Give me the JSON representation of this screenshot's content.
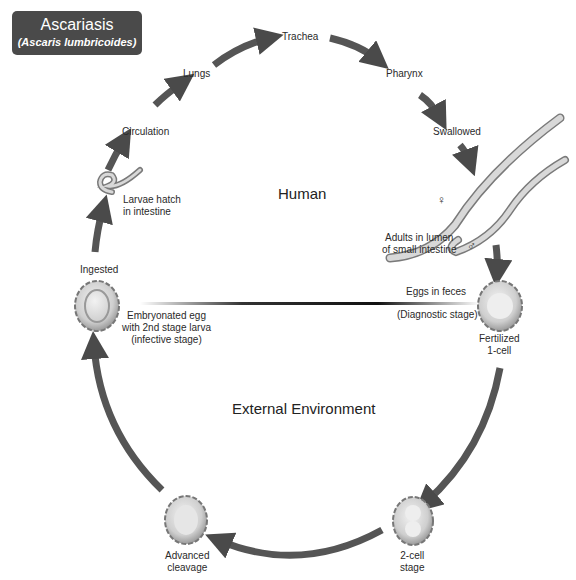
{
  "title": {
    "main": "Ascariasis",
    "subtitle": "(Ascaris lumbricoides)"
  },
  "zones": {
    "upper": "Human",
    "lower": "External Environment"
  },
  "stages": {
    "trachea": "Trachea",
    "lungs": "Lungs",
    "pharynx": "Pharynx",
    "circulation": "Circulation",
    "swallowed": "Swallowed",
    "larvae_hatch_1": "Larvae hatch",
    "larvae_hatch_2": "in intestine",
    "adults_1": "Adults in lumen",
    "adults_2": "of small intestine",
    "female_symbol": "♀",
    "male_symbol": "♂",
    "ingested": "Ingested",
    "embryonated_1": "Embryonated egg",
    "embryonated_2": "with 2nd stage larva",
    "embryonated_3": "(infective stage)",
    "eggs_feces": "Eggs in feces",
    "diagnostic": "(Diagnostic stage)",
    "fertilized_1": "Fertilized",
    "fertilized_2": "1-cell",
    "advanced_1": "Advanced",
    "advanced_2": "cleavage",
    "twocell_1": "2-cell",
    "twocell_2": "stage"
  }
}
